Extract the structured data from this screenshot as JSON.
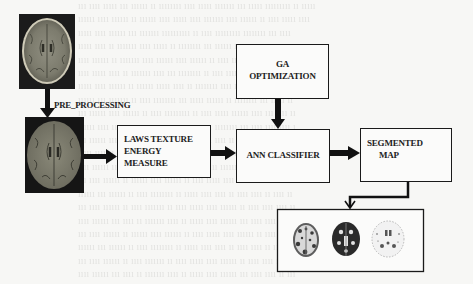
{
  "diagram": {
    "nodes": {
      "input_mri": {
        "label": "",
        "icon": "brain-mri-axial-image"
      },
      "preprocessed_mri": {
        "label": "",
        "icon": "brain-mri-preprocessed-image"
      },
      "preprocessing": {
        "label": "PRE_PROCESSING"
      },
      "laws": {
        "line1": "LAWS TEXTURE",
        "line2": "ENERGY",
        "line3": "MEASURE"
      },
      "ga": {
        "line1": "GA",
        "line2": "OPTIMIZATION"
      },
      "ann": {
        "label": "ANN CLASSIFIER"
      },
      "segmented": {
        "line1": "SEGMENTED",
        "line2": "MAP"
      },
      "results": {
        "label": "",
        "images": [
          "white-matter-map",
          "gray-matter-map",
          "csf-map"
        ]
      }
    },
    "edges": [
      {
        "from": "input_mri",
        "to": "preprocessed_mri",
        "label": "PRE_PROCESSING"
      },
      {
        "from": "preprocessed_mri",
        "to": "laws"
      },
      {
        "from": "laws",
        "to": "ann"
      },
      {
        "from": "ga",
        "to": "ann"
      },
      {
        "from": "ann",
        "to": "segmented"
      },
      {
        "from": "segmented",
        "to": "results"
      }
    ]
  },
  "colors": {
    "background": "#f7f7f5",
    "stroke": "#1a1a1a",
    "text": "#222222"
  }
}
